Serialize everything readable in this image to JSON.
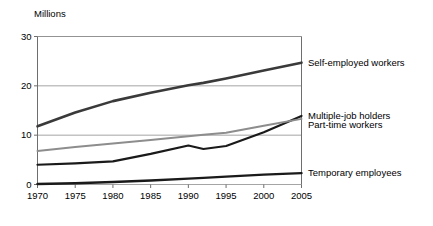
{
  "chart_data": {
    "type": "line",
    "title": "",
    "subtitle": "",
    "xlabel": "",
    "ylabel": "Millions",
    "unit_label": "Millions",
    "x": [
      1970,
      1975,
      1980,
      1985,
      1990,
      1992,
      1995,
      2000,
      2005
    ],
    "xlim": [
      1970,
      2005
    ],
    "ylim": [
      0,
      30
    ],
    "xticks": [
      "1970",
      "1975",
      "1980",
      "1985",
      "1990",
      "1995",
      "2000",
      "2005"
    ],
    "xtick_values": [
      1970,
      1975,
      1980,
      1985,
      1990,
      1995,
      2000,
      2005
    ],
    "yticks": [
      "0",
      "10",
      "20",
      "30"
    ],
    "ytick_values": [
      0,
      10,
      20,
      30
    ],
    "grid": "horizontal",
    "legend_position": "right-inline",
    "series": [
      {
        "name": "Self-employed workers",
        "color": "#3a3a3a",
        "width": 2.6,
        "values": [
          11.8,
          14.6,
          16.9,
          18.6,
          20.1,
          20.6,
          21.5,
          23.1,
          24.7
        ],
        "label_y": 24.7
      },
      {
        "name": "Multiple-job holders",
        "color": "#1a1a1a",
        "width": 2.2,
        "values": [
          4.0,
          4.3,
          4.7,
          6.2,
          7.9,
          7.2,
          7.8,
          10.6,
          13.9
        ],
        "label_y": 13.9
      },
      {
        "name": "Part-time workers",
        "color": "#8d8d8d",
        "width": 2.0,
        "values": [
          6.8,
          7.6,
          8.3,
          9.0,
          9.8,
          10.1,
          10.5,
          11.9,
          13.3
        ],
        "label_y": 12.0
      },
      {
        "name": "Temporary employees",
        "color": "#1a1a1a",
        "width": 2.4,
        "values": [
          0.1,
          0.25,
          0.5,
          0.8,
          1.2,
          1.35,
          1.6,
          2.0,
          2.3
        ],
        "label_y": 2.3
      }
    ]
  }
}
